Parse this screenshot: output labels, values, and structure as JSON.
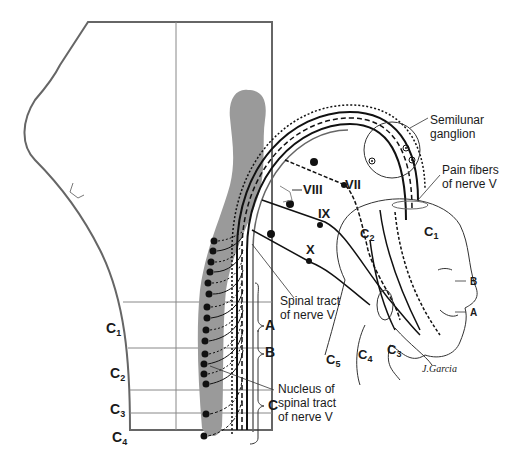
{
  "figure": {
    "labels": {
      "semilunar_ganglion": [
        "Semilunar",
        "ganglion"
      ],
      "pain_fibers": [
        "Pain fibers",
        "of nerve V"
      ],
      "spinal_tract": [
        "Spinal tract",
        "of nerve V"
      ],
      "nucleus": [
        "Nucleus of",
        "spinal tract",
        "of nerve V"
      ],
      "nerve_vii": "VII",
      "nerve_viii": "VIII",
      "nerve_ix": "IX",
      "nerve_x": "X",
      "brace_a": "A",
      "brace_b": "B",
      "brace_c": "C",
      "face_b": "B",
      "face_a": "A",
      "signature": "J.Garcia"
    },
    "segments_left": [
      {
        "main": "C",
        "sub": "1"
      },
      {
        "main": "C",
        "sub": "2"
      },
      {
        "main": "C",
        "sub": "3"
      },
      {
        "main": "C",
        "sub": "4"
      }
    ],
    "dermatomes_head": [
      {
        "main": "C",
        "sub": "2"
      },
      {
        "main": "C",
        "sub": "1"
      },
      {
        "main": "C",
        "sub": "5"
      },
      {
        "main": "C",
        "sub": "4"
      },
      {
        "main": "C",
        "sub": "3"
      }
    ],
    "colors": {
      "outline": "#555555",
      "nucleus_fill": "#9a9a9a",
      "line": "#111111",
      "thin": "#777777"
    }
  }
}
